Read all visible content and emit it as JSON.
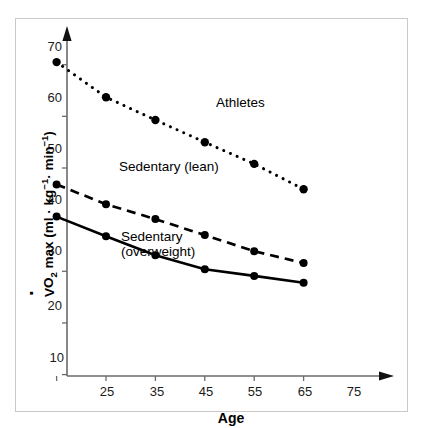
{
  "chart_data": {
    "type": "line",
    "title": "",
    "xlabel": "Age",
    "ylabel": "VO2 max (ml · kg-1 · min-1)",
    "ylabel_parts": {
      "prefix": "V",
      "dotted": "V",
      "sub": "2",
      "mid": "O",
      "text_after": " max (ml · kg",
      "sup1": "-1",
      "mid2": " · min",
      "sup2": "-1",
      "close": ")"
    },
    "x": [
      25,
      35,
      45,
      55,
      65,
      75
    ],
    "xtick_labels": [
      "25",
      "35",
      "45",
      "55",
      "65",
      "75"
    ],
    "ytick_labels": [
      "70",
      "60",
      "50",
      "40",
      "30",
      "20",
      "10"
    ],
    "yticks": [
      70,
      60,
      50,
      40,
      30,
      20,
      10
    ],
    "xlim": [
      20,
      80
    ],
    "ylim": [
      5,
      74
    ],
    "grid": false,
    "legend_position": "inline-annotations",
    "series": [
      {
        "name": "Athletes",
        "label": "Athletes",
        "style": "dotted",
        "color": "#000000",
        "values": [
          70.5,
          63.7,
          59.3,
          55.0,
          50.8,
          45.9
        ]
      },
      {
        "name": "Sedentary (lean)",
        "label": "Sedentary (lean)",
        "style": "dashed",
        "color": "#000000",
        "values": [
          46.8,
          43.0,
          40.1,
          37.0,
          33.9,
          31.6
        ]
      },
      {
        "name": "Sedentary (overweight)",
        "label_line1": "Sedentary",
        "label_line2": "(overweight)",
        "style": "solid",
        "color": "#000000",
        "values": [
          40.6,
          36.8,
          33.1,
          30.4,
          29.1,
          27.8
        ]
      }
    ],
    "annotations": [
      {
        "text": "Athletes",
        "series": "Athletes"
      },
      {
        "text": "Sedentary (lean)",
        "series": "Sedentary (lean)"
      },
      {
        "text": "Sedentary (overweight)",
        "series": "Sedentary (overweight)"
      }
    ]
  },
  "axis": {
    "x_title": "Age",
    "y_title_plain": "VO2 max (ml · kg-1 · min-1)"
  },
  "colors": {
    "ink": "#000000",
    "axis": "#6b6b6b",
    "frame": "#c9c9c9",
    "background": "#ffffff"
  }
}
